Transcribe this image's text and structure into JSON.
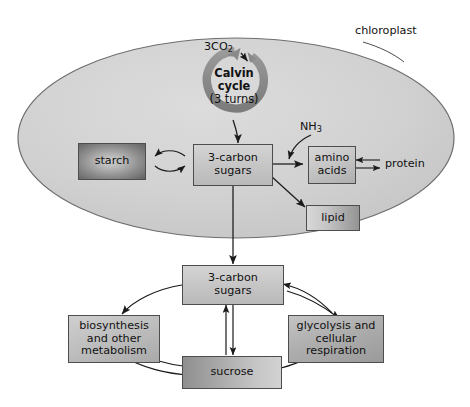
{
  "figure": {
    "type": "biological-pathway-diagram",
    "background": "#ffffff"
  },
  "colors": {
    "chloroplast_fill": "#d0d0d0",
    "chloroplast_stroke": "#6e6e6e",
    "box_stroke": "#4d4d4d",
    "arrow": "#1a1a1a",
    "calvin_ring": "#8a8a8a",
    "text": "#111111"
  },
  "chloroplast": {
    "label": "chloroplast",
    "calvin": {
      "name_line1": "Calvin",
      "name_line2": "cycle",
      "turns": "(3 turns)",
      "input_label": "3CO",
      "input_sub": "2"
    },
    "boxes": {
      "starch": "starch",
      "sugars": "3-carbon\nsugars",
      "amino_acids": "amino\nacids",
      "lipid": "lipid"
    },
    "labels": {
      "nh3_main": "NH",
      "nh3_sub": "3",
      "protein": "protein"
    }
  },
  "cytosol": {
    "boxes": {
      "sugars": "3-carbon\nsugars",
      "biosynthesis": "biosynthesis\nand other\nmetabolism",
      "sucrose": "sucrose",
      "glycolysis": "glycolysis and\ncellular\nrespiration"
    }
  },
  "relations": [
    {
      "from": "3CO2",
      "to": "Calvin cycle",
      "kind": "arrow"
    },
    {
      "from": "Calvin cycle",
      "to": "3-carbon sugars (chloroplast)",
      "kind": "curved-arrow"
    },
    {
      "from": "starch",
      "to": "3-carbon sugars (chloroplast)",
      "kind": "reversible-curved"
    },
    {
      "from": "3-carbon sugars (chloroplast)",
      "to": "amino acids",
      "kind": "arrow"
    },
    {
      "from": "NH3",
      "to": "amino acids pathway",
      "kind": "curved-arrow"
    },
    {
      "from": "amino acids",
      "to": "protein",
      "kind": "reversible-double"
    },
    {
      "from": "3-carbon sugars (chloroplast)",
      "to": "lipid",
      "kind": "arrow"
    },
    {
      "from": "3-carbon sugars (chloroplast)",
      "to": "3-carbon sugars (cytosol)",
      "kind": "arrow"
    },
    {
      "from": "3-carbon sugars (cytosol)",
      "to": "biosynthesis and other metabolism",
      "kind": "curved-arrow"
    },
    {
      "from": "3-carbon sugars (cytosol)",
      "to": "sucrose",
      "kind": "reversible-vertical"
    },
    {
      "from": "biosynthesis and other metabolism",
      "to": "sucrose",
      "kind": "reversible-curved"
    },
    {
      "from": "sucrose",
      "to": "glycolysis and cellular respiration",
      "kind": "curved-arrow"
    },
    {
      "from": "glycolysis and cellular respiration",
      "to": "3-carbon sugars (cytosol)",
      "kind": "reversible-curved"
    }
  ]
}
